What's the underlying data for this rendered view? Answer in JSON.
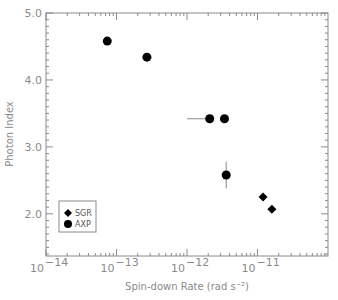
{
  "chart_data": {
    "type": "scatter",
    "title": "",
    "xlabel": "Spin-down Rate (rad s⁻²)",
    "ylabel": "Photon Index",
    "xscale": "log",
    "xlim": [
      1e-14,
      1e-10
    ],
    "ylim": [
      1.37,
      5.0
    ],
    "x_ticks": [
      {
        "value": 1e-14,
        "base": "10",
        "exp": "−14"
      },
      {
        "value": 1e-13,
        "base": "10",
        "exp": "−13"
      },
      {
        "value": 1e-12,
        "base": "10",
        "exp": "−12"
      },
      {
        "value": 1e-11,
        "base": "10",
        "exp": "−11"
      }
    ],
    "y_ticks": [
      {
        "value": 2.0,
        "label": "2.0"
      },
      {
        "value": 3.0,
        "label": "3.0"
      },
      {
        "value": 4.0,
        "label": "4.0"
      },
      {
        "value": 5.0,
        "label": "5.0"
      }
    ],
    "grid": false,
    "legend_position": "lower-left",
    "series": [
      {
        "name": "SGR",
        "marker": "diamond",
        "points": [
          {
            "x": 1.2e-11,
            "y": 2.25
          },
          {
            "x": 1.6e-11,
            "y": 2.07
          }
        ]
      },
      {
        "name": "AXP",
        "marker": "circle",
        "points": [
          {
            "x": 7.4e-14,
            "y": 4.58
          },
          {
            "x": 2.7e-13,
            "y": 4.34
          },
          {
            "x": 2.1e-12,
            "y": 3.42,
            "xerr_low": 1.1e-12
          },
          {
            "x": 3.4e-12,
            "y": 3.42
          },
          {
            "x": 3.6e-12,
            "y": 2.58,
            "yerr": 0.2
          }
        ]
      }
    ]
  },
  "legend": {
    "items": [
      {
        "label": "SGR",
        "marker": "diamond"
      },
      {
        "label": "AXP",
        "marker": "circle"
      }
    ]
  },
  "colors": {
    "axis": "#8a8a8a",
    "marker": "#000000",
    "errorbar": "#8a8a8a",
    "background": "#ffffff"
  }
}
